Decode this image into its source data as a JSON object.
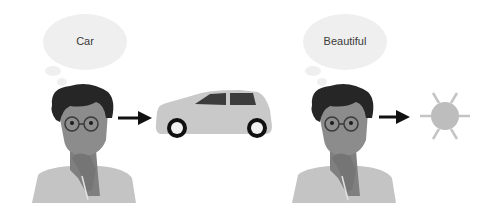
{
  "panels": [
    {
      "thought": "Car",
      "object": "car-icon"
    },
    {
      "thought": "Beautiful",
      "object": "sun-icon"
    }
  ],
  "colors": {
    "bubble": "#efefef",
    "hair": "#262626",
    "skin": "#8c8c8c",
    "skin_shadow": "#7a7a7a",
    "shirt": "#c4c4c4",
    "arrow": "#111111",
    "car_body": "#c9c9c9",
    "car_window": "#3c3c3c",
    "sun": "#bdbdbd"
  }
}
